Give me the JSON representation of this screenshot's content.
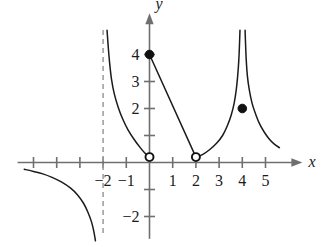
{
  "figure": {
    "kind": "cartesian-graph",
    "background_color": "#ffffff",
    "curve_color": "#1b1b1b",
    "axis_color": "#6f6f6f",
    "asymptote_color": "#9a9a9a",
    "marker_fill_color": "#111111"
  },
  "axes": {
    "x_label": "x",
    "y_label": "y",
    "x_ticks": [
      {
        "value": -5,
        "label": ""
      },
      {
        "value": -4,
        "label": ""
      },
      {
        "value": -3,
        "label": ""
      },
      {
        "value": -2,
        "label": "−2"
      },
      {
        "value": -1,
        "label": "−1"
      },
      {
        "value": 1,
        "label": "1"
      },
      {
        "value": 2,
        "label": "2"
      },
      {
        "value": 3,
        "label": "3"
      },
      {
        "value": 4,
        "label": "4"
      },
      {
        "value": 5,
        "label": "5"
      }
    ],
    "y_ticks": [
      {
        "value": 4,
        "label": "4"
      },
      {
        "value": 3,
        "label": "3"
      },
      {
        "value": 2,
        "label": "2"
      },
      {
        "value": 1,
        "label": ""
      },
      {
        "value": -1,
        "label": ""
      },
      {
        "value": -2,
        "label": "−2"
      }
    ],
    "xlim": [
      -5.6,
      5.9
    ],
    "ylim": [
      -2.9,
      4.9
    ],
    "grid": false
  },
  "chart_data": {
    "type": "line",
    "title": "",
    "xlabel": "x",
    "ylabel": "y",
    "xlim": [
      -5.6,
      5.9
    ],
    "ylim": [
      -2.9,
      4.9
    ],
    "grid": false,
    "asymptotes": [
      {
        "kind": "vertical",
        "x": -2,
        "style": "dashed",
        "drawn": true
      },
      {
        "kind": "vertical",
        "x": 4,
        "style": "implied",
        "drawn": false
      }
    ],
    "series": [
      {
        "name": "branch-lower-left",
        "type": "curve",
        "points": [
          [
            -5.4,
            -0.25
          ],
          [
            -5.0,
            -0.33
          ],
          [
            -4.6,
            -0.42
          ],
          [
            -4.2,
            -0.55
          ],
          [
            -3.8,
            -0.72
          ],
          [
            -3.4,
            -0.95
          ],
          [
            -3.1,
            -1.2
          ],
          [
            -2.85,
            -1.5
          ],
          [
            -2.65,
            -1.85
          ],
          [
            -2.5,
            -2.2
          ],
          [
            -2.4,
            -2.55
          ],
          [
            -2.33,
            -2.9
          ]
        ]
      },
      {
        "name": "branch-upper-left",
        "type": "curve",
        "points": [
          [
            -1.83,
            4.9
          ],
          [
            -1.78,
            4.3
          ],
          [
            -1.72,
            3.7
          ],
          [
            -1.64,
            3.1
          ],
          [
            -1.52,
            2.55
          ],
          [
            -1.35,
            2.05
          ],
          [
            -1.15,
            1.6
          ],
          [
            -0.92,
            1.2
          ],
          [
            -0.66,
            0.85
          ],
          [
            -0.4,
            0.55
          ],
          [
            -0.18,
            0.33
          ],
          [
            -0.03,
            0.21
          ]
        ]
      },
      {
        "name": "segment-zero-to-two",
        "type": "line-segment",
        "points": [
          [
            0,
            4
          ],
          [
            2,
            0.2
          ]
        ]
      },
      {
        "name": "branch-left-of-four",
        "type": "curve",
        "points": [
          [
            2.05,
            0.2
          ],
          [
            2.3,
            0.3
          ],
          [
            2.6,
            0.48
          ],
          [
            2.9,
            0.72
          ],
          [
            3.15,
            1.0
          ],
          [
            3.35,
            1.35
          ],
          [
            3.52,
            1.75
          ],
          [
            3.65,
            2.2
          ],
          [
            3.74,
            2.7
          ],
          [
            3.8,
            3.2
          ],
          [
            3.85,
            3.8
          ],
          [
            3.88,
            4.4
          ],
          [
            3.9,
            4.9
          ]
        ]
      },
      {
        "name": "branch-right-of-four",
        "type": "curve",
        "points": [
          [
            4.12,
            4.9
          ],
          [
            4.14,
            4.4
          ],
          [
            4.17,
            3.8
          ],
          [
            4.22,
            3.2
          ],
          [
            4.3,
            2.7
          ],
          [
            4.42,
            2.2
          ],
          [
            4.58,
            1.78
          ],
          [
            4.75,
            1.42
          ],
          [
            4.95,
            1.12
          ],
          [
            5.15,
            0.88
          ],
          [
            5.38,
            0.68
          ],
          [
            5.6,
            0.55
          ]
        ]
      }
    ],
    "markers": [
      {
        "name": "filled-point-0-4",
        "x": 0,
        "y": 4,
        "style": "filled"
      },
      {
        "name": "open-point-0-0",
        "x": 0,
        "y": 0.2,
        "style": "open"
      },
      {
        "name": "open-point-2-0",
        "x": 2,
        "y": 0.2,
        "style": "open"
      },
      {
        "name": "filled-point-4-2",
        "x": 4,
        "y": 2,
        "style": "filled"
      }
    ]
  }
}
